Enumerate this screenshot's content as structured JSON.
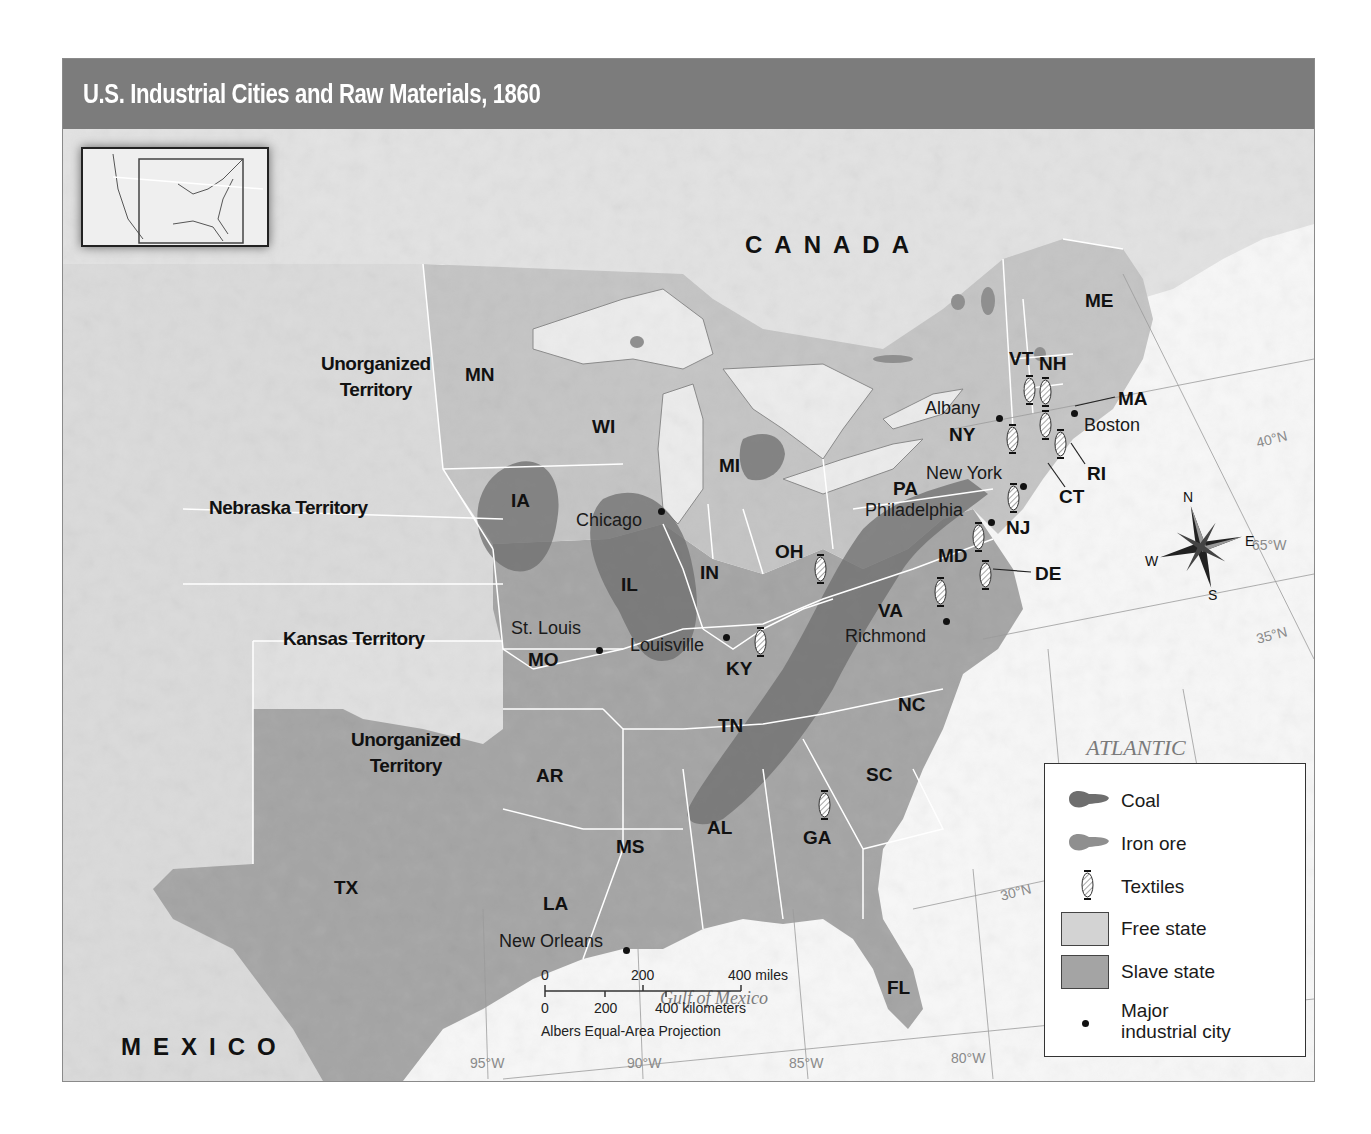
{
  "title": "U.S. Industrial Cities and Raw Materials, 1860",
  "countries": {
    "canada": "CANADA",
    "mexico": "MEXICO"
  },
  "water_bodies": {
    "atlantic_line1": "ATLANTIC",
    "atlantic_line2": "OCEAN",
    "gulf": "Gulf of Mexico"
  },
  "territories": [
    {
      "id": "unorg-north",
      "line1": "Unorganized",
      "line2": "Territory"
    },
    {
      "id": "nebraska",
      "line1": "Nebraska Territory",
      "line2": ""
    },
    {
      "id": "kansas",
      "line1": "Kansas Territory",
      "line2": ""
    },
    {
      "id": "unorg-south",
      "line1": "Unorganized",
      "line2": "Territory"
    }
  ],
  "states": {
    "ME": "ME",
    "VT": "VT",
    "NH": "NH",
    "MA": "MA",
    "RI": "RI",
    "CT": "CT",
    "NY": "NY",
    "NJ": "NJ",
    "PA": "PA",
    "DE": "DE",
    "MD": "MD",
    "VA": "VA",
    "NC": "NC",
    "SC": "SC",
    "GA": "GA",
    "FL": "FL",
    "AL": "AL",
    "MS": "MS",
    "LA": "LA",
    "TX": "TX",
    "AR": "AR",
    "TN": "TN",
    "KY": "KY",
    "OH": "OH",
    "IN": "IN",
    "IL": "IL",
    "MI": "MI",
    "WI": "WI",
    "MN": "MN",
    "IA": "IA",
    "MO": "MO"
  },
  "cities": [
    {
      "name": "Boston"
    },
    {
      "name": "Albany"
    },
    {
      "name": "New York"
    },
    {
      "name": "Philadelphia"
    },
    {
      "name": "Richmond"
    },
    {
      "name": "Chicago"
    },
    {
      "name": "St. Louis"
    },
    {
      "name": "Louisville"
    },
    {
      "name": "New Orleans"
    }
  ],
  "grid_labels": {
    "lat40": "40°N",
    "lat35": "35°N",
    "lat30": "30°N",
    "lon65": "65°W",
    "lon70": "70°W",
    "lon75": "75°W",
    "lon80": "80°W",
    "lon85": "85°W",
    "lon90": "90°W",
    "lon95": "95°W"
  },
  "compass": {
    "n": "N",
    "s": "S",
    "e": "E",
    "w": "W"
  },
  "scale": {
    "miles_0": "0",
    "miles_200": "200",
    "miles_400": "400 miles",
    "km_0": "0",
    "km_200": "200",
    "km_400": "400 kilometers",
    "projection": "Albers Equal-Area Projection"
  },
  "legend": {
    "items": [
      {
        "label": "Coal",
        "symbol": "coal-blob",
        "color": "#6e6e6e"
      },
      {
        "label": "Iron ore",
        "symbol": "iron-blob",
        "color": "#8f8f8f"
      },
      {
        "label": "Textiles",
        "symbol": "textile-spool",
        "color": "#ffffff"
      },
      {
        "label": "Free state",
        "symbol": "swatch",
        "color": "#d3d3d3"
      },
      {
        "label": "Slave state",
        "symbol": "swatch",
        "color": "#a4a4a4"
      },
      {
        "label": "Major industrial city",
        "line1": "Major",
        "line2": "industrial city",
        "symbol": "dot",
        "color": "#111111"
      }
    ]
  },
  "colors": {
    "title_bar": "#7c7c7c",
    "free_state": "#d3d3d3",
    "slave_state": "#a4a4a4",
    "territory": "#dcdcdc",
    "coal": "#6e6e6e",
    "iron": "#8f8f8f",
    "water": "#f7f7f7"
  }
}
